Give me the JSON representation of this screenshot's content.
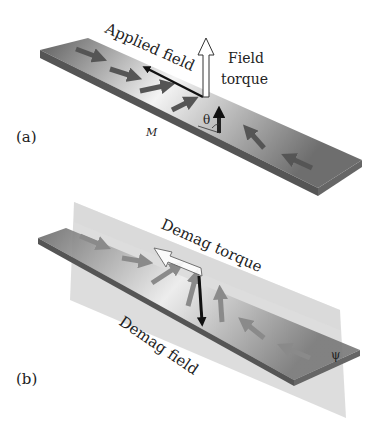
{
  "panel_a": {
    "tag": "(a)",
    "applied_field_label": "Applied field",
    "field_torque_line1": "Field",
    "field_torque_line2": "torque",
    "theta_symbol": "θ",
    "m_symbol": "M"
  },
  "panel_b": {
    "tag": "(b)",
    "demag_torque_label": "Demag torque",
    "demag_field_label": "Demag field",
    "psi_symbol": "ψ"
  },
  "colors": {
    "strip_dark": "#6a6a6a",
    "strip_light": "#f2f2f2",
    "arrow": "#555555",
    "applied_field_arrow": "#111111",
    "demag_plane": "#cfcfcf"
  }
}
